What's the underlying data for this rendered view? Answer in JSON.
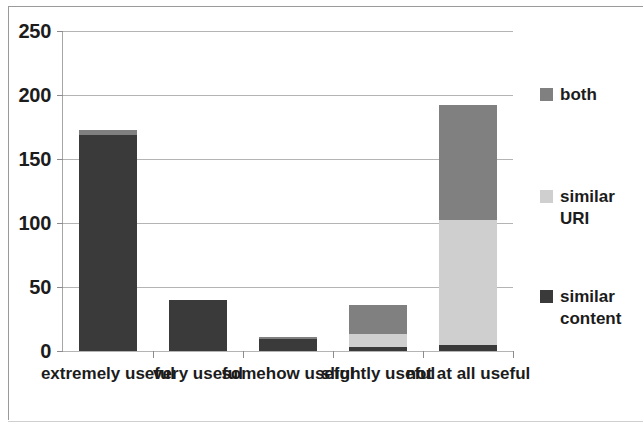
{
  "chart_data": {
    "type": "bar",
    "stacked": true,
    "title": "",
    "xlabel": "",
    "ylabel": "",
    "ylim": [
      0,
      250
    ],
    "ytick_values": [
      0,
      50,
      100,
      150,
      200,
      250
    ],
    "ytick_labels": [
      "0",
      "50",
      "100",
      "150",
      "200",
      "250"
    ],
    "grid": true,
    "legend_position": "right",
    "categories": [
      "extremely\nuseful",
      "very\nuseful",
      "somehow\nuseful",
      "slightly\nuseful",
      "not at all\nuseful"
    ],
    "series": [
      {
        "name": "similar content",
        "color": "#3a3a3a",
        "values": [
          168,
          40,
          9,
          3,
          5
        ]
      },
      {
        "name": "similar URI",
        "color": "#cfcfcf",
        "values": [
          0,
          0,
          0,
          10,
          97
        ]
      },
      {
        "name": "both",
        "color": "#808080",
        "values": [
          4,
          0,
          2,
          23,
          90
        ]
      }
    ],
    "totals": [
      172,
      40,
      11,
      36,
      192
    ]
  },
  "legend": {
    "entries": [
      {
        "label": "both",
        "color": "#808080"
      },
      {
        "label": "similar\nURI",
        "color": "#cfcfcf"
      },
      {
        "label": "similar\ncontent",
        "color": "#3a3a3a"
      }
    ]
  },
  "axes": {
    "y_max": 250,
    "y_min": 0
  }
}
